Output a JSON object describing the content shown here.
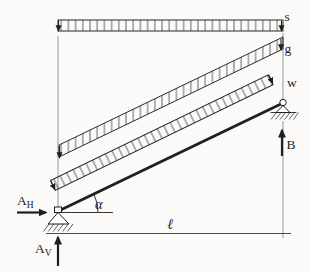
{
  "colors": {
    "ink": "#1f1f1f",
    "paper": "#fbfaf8",
    "faint": "#555555"
  },
  "loads": {
    "s": "s",
    "g": "g",
    "w": "w"
  },
  "reactions": {
    "a_h": {
      "base": "A",
      "sub": "H"
    },
    "a_v": {
      "base": "A",
      "sub": "V"
    },
    "b": "B"
  },
  "dimensions": {
    "angle": "α",
    "span": "ℓ"
  }
}
